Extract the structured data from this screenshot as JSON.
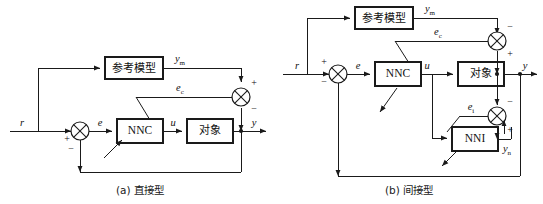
{
  "figure": {
    "background": "#ffffff",
    "line_color": "#1a1a1a",
    "panels": [
      {
        "id": "a",
        "caption": "(a) 直接型",
        "blocks": [
          {
            "key": "reference_model",
            "label": "参考模型"
          },
          {
            "key": "nnc",
            "label": "NNC"
          },
          {
            "key": "plant",
            "label": "对象"
          }
        ],
        "signals": {
          "reference": "r",
          "error": "e",
          "control": "u",
          "output": "y",
          "model_output": "y",
          "model_output_sub": "m",
          "control_error": "e",
          "control_error_sub": "c"
        },
        "signs": {
          "sum_left_plus": "+",
          "sum_left_minus": "−",
          "sum_right_plus": "+",
          "sum_right_minus": "−"
        }
      },
      {
        "id": "b",
        "caption": "(b) 间接型",
        "blocks": [
          {
            "key": "reference_model",
            "label": "参考模型"
          },
          {
            "key": "nnc",
            "label": "NNC"
          },
          {
            "key": "plant",
            "label": "对象"
          },
          {
            "key": "nni",
            "label": "NNI"
          }
        ],
        "signals": {
          "reference": "r",
          "error": "e",
          "control": "u",
          "output": "y",
          "model_output": "y",
          "model_output_sub": "m",
          "control_error": "e",
          "control_error_sub": "c",
          "identification_error": "e",
          "identification_error_sub": "i",
          "nni_output": "y",
          "nni_output_sub": "n"
        },
        "signs": {
          "sum_left_plus": "+",
          "sum_left_minus": "−",
          "sum_top_minus": "−",
          "sum_top_plus": "+",
          "sum_low_minus": "−",
          "sum_low_plus": "+"
        }
      }
    ]
  }
}
